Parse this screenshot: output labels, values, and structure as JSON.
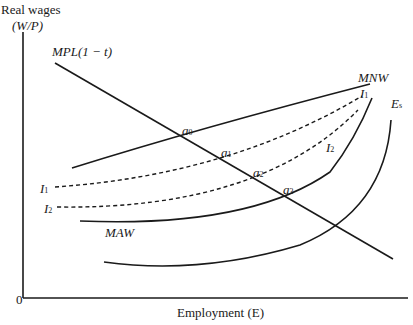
{
  "axes": {
    "y_label_line1": "Real wages",
    "y_label_line2": "(W/P)",
    "x_label": "Employment (E)",
    "origin": "0"
  },
  "curves": {
    "mpl": "MPL(1 − t)",
    "mnw": "MNW",
    "maw": "MAW",
    "i1_left": "I",
    "i1_left_sub": "1",
    "i2_left": "I",
    "i2_left_sub": "2",
    "i1_right": "I",
    "i1_right_sub": "1",
    "i2_right": "I",
    "i2_right_sub": "2",
    "es": "E",
    "es_sub": "s"
  },
  "points": [
    {
      "label": "a",
      "sub": "0"
    },
    {
      "label": "a",
      "sub": "1"
    },
    {
      "label": "a",
      "sub": "2"
    },
    {
      "label": "a",
      "sub": "3"
    }
  ],
  "colors": {
    "line": "#1a1a1a",
    "background": "#ffffff"
  }
}
